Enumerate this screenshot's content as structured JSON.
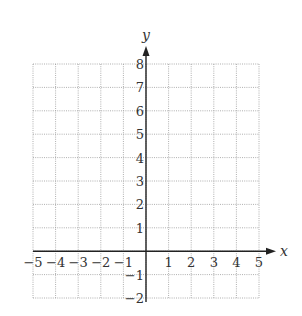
{
  "chart_data": {
    "type": "scatter",
    "title": "",
    "xlabel": "x",
    "ylabel": "y",
    "xlim": [
      -5,
      5
    ],
    "ylim": [
      -2,
      8
    ],
    "grid": true,
    "grid_style": "dotted",
    "x_ticks": [
      -5,
      -4,
      -3,
      -2,
      -1,
      1,
      2,
      3,
      4,
      5
    ],
    "y_ticks": [
      -2,
      -1,
      1,
      2,
      3,
      4,
      5,
      6,
      7,
      8
    ],
    "x_tick_labels": [
      "−5",
      "−4",
      "−3",
      "−2",
      "−1",
      "1",
      "2",
      "3",
      "4",
      "5"
    ],
    "y_tick_labels": [
      "−2",
      "−1",
      "1",
      "2",
      "3",
      "4",
      "5",
      "6",
      "7",
      "8"
    ],
    "series": [],
    "legend": null
  },
  "axes": {
    "x_label": "x",
    "y_label": "y"
  },
  "colors": {
    "axis": "#222222",
    "grid": "#9a9a9a",
    "text": "#333333"
  }
}
